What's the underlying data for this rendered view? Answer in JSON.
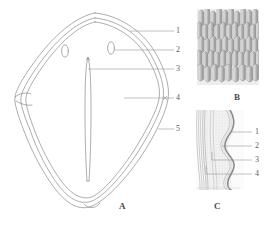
{
  "figure": {
    "background_color": "#ffffff",
    "ink_color": "#6e6e6e",
    "label_color": "#5c5c5c"
  },
  "panels": [
    {
      "id": "A",
      "letter": "A",
      "letter_x": 119,
      "letter_y": 202,
      "description": "whole-mount outline, teardrop/shield shaped with double contour, two small ovate pores and a median elongate slit",
      "callouts": [
        {
          "label": "1",
          "x": 176,
          "y": 27,
          "leader_from_x": 130,
          "leader_from_y": 31
        },
        {
          "label": "2",
          "x": 176,
          "y": 46,
          "leader_from_x": 112,
          "leader_from_y": 50
        },
        {
          "label": "3",
          "x": 176,
          "y": 65,
          "leader_from_x": 88,
          "leader_from_y": 69
        },
        {
          "label": "4",
          "x": 176,
          "y": 94,
          "leader_from_x": 124,
          "leader_from_y": 98
        },
        {
          "label": "5",
          "x": 176,
          "y": 125,
          "leader_from_x": 157,
          "leader_from_y": 129
        }
      ]
    },
    {
      "id": "B",
      "letter": "B",
      "letter_x": 234,
      "letter_y": 93,
      "description": "surface detail, dense overlapping columnar papillae in rows",
      "callouts": []
    },
    {
      "id": "C",
      "letter": "C",
      "letter_x": 214,
      "letter_y": 202,
      "description": "transverse section showing striated inner layer, stippled matrix and undulating outer band",
      "callouts": [
        {
          "label": "1",
          "x": 255,
          "y": 129,
          "leader_from_x": 231,
          "leader_from_y": 132
        },
        {
          "label": "2",
          "x": 255,
          "y": 143,
          "leader_from_x": 222,
          "leader_from_y": 146
        },
        {
          "label": "3",
          "x": 255,
          "y": 157,
          "leader_from_x": 212,
          "leader_from_y": 160
        },
        {
          "label": "4",
          "x": 255,
          "y": 171,
          "leader_from_x": 206,
          "leader_from_y": 174
        }
      ]
    }
  ]
}
